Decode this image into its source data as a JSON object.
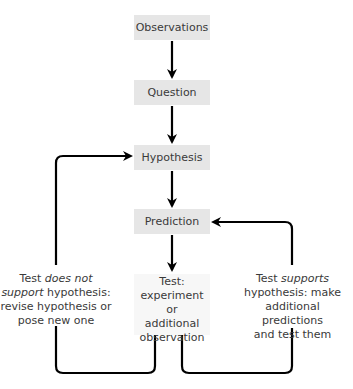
{
  "diagram": {
    "nodes": [
      {
        "id": "observations",
        "label": "Observations"
      },
      {
        "id": "question",
        "label": "Question"
      },
      {
        "id": "hypothesis",
        "label": "Hypothesis"
      },
      {
        "id": "prediction",
        "label": "Prediction"
      },
      {
        "id": "test",
        "lines": [
          "Test:",
          "experiment or",
          "additional",
          "observation"
        ]
      }
    ],
    "loops": {
      "not_support": {
        "prefix": "Test ",
        "emph": "does not",
        "line2_emph": "support",
        "line2_rest": " hypothesis:",
        "line3": "revise hypothesis or",
        "line4": "pose new one",
        "target": "hypothesis"
      },
      "supports": {
        "prefix": "Test ",
        "emph": "supports",
        "line2": "hypothesis: make",
        "line3": "additional predictions",
        "line4": "and test them",
        "target": "prediction"
      }
    },
    "colors": {
      "box_fill": "#e6e6e6",
      "test_fill": "#f7f7f7",
      "arrow": "#000000",
      "text": "#3a3a3a"
    }
  }
}
